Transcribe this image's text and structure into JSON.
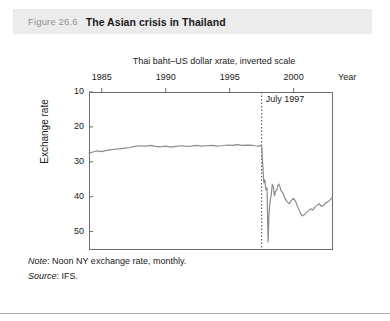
{
  "figure": {
    "number": "Figure 26.6",
    "title": "The Asian crisis in Thailand"
  },
  "footnotes": {
    "note_label": "Note",
    "note_text": ": Noon NY exchange rate, monthly.",
    "source_label": "Source",
    "source_text": ": IFS."
  },
  "colors": {
    "header_band": "#ececec",
    "figure_number": "#8f8f8f",
    "text": "#1a1a1a",
    "line": "#8c8c8c",
    "axis": "#6e6e6e",
    "bottom_rule": "#b0b0b0"
  },
  "chart_data": {
    "type": "line",
    "title": "Thai baht–US dollar xrate, inverted scale",
    "xlabel": "Year",
    "ylabel": "Exchange rate",
    "xlim": [
      1984.0,
      2003.0
    ],
    "ylim": [
      10,
      55
    ],
    "y_inverted": true,
    "grid": false,
    "legend": "none",
    "xticks": [
      1985,
      1990,
      1995,
      2000
    ],
    "xtick_labels": [
      "1985",
      "1990",
      "1995",
      "2000"
    ],
    "yticks": [
      10,
      20,
      30,
      40,
      50
    ],
    "ytick_labels": [
      "10",
      "20",
      "30",
      "40",
      "50"
    ],
    "annotations": [
      {
        "label": "July 1997",
        "x": 1997.5,
        "type": "vertical-dotted-line"
      }
    ],
    "series": [
      {
        "name": "Thai baht per US dollar",
        "x": [
          1984.0,
          1984.3,
          1984.6,
          1985.0,
          1985.3,
          1985.6,
          1986.0,
          1986.4,
          1986.8,
          1987.2,
          1987.6,
          1988.0,
          1988.4,
          1988.8,
          1989.2,
          1989.6,
          1990.0,
          1990.4,
          1990.8,
          1991.2,
          1991.6,
          1992.0,
          1992.4,
          1992.8,
          1993.2,
          1993.6,
          1994.0,
          1994.4,
          1994.8,
          1995.2,
          1995.6,
          1996.0,
          1996.4,
          1996.8,
          1997.0,
          1997.25,
          1997.45,
          1997.5,
          1997.58,
          1997.67,
          1997.75,
          1997.83,
          1997.92,
          1998.0,
          1998.08,
          1998.17,
          1998.25,
          1998.33,
          1998.42,
          1998.5,
          1998.58,
          1998.67,
          1998.75,
          1998.83,
          1998.92,
          1999.0,
          1999.17,
          1999.33,
          1999.5,
          1999.67,
          1999.83,
          2000.0,
          2000.17,
          2000.33,
          2000.5,
          2000.67,
          2000.83,
          2001.0,
          2001.17,
          2001.33,
          2001.5,
          2001.67,
          2001.83,
          2002.0,
          2002.17,
          2002.33,
          2002.5,
          2002.67,
          2002.83,
          2003.0
        ],
        "y": [
          27.6,
          27.2,
          26.9,
          27.1,
          26.8,
          26.6,
          26.4,
          26.3,
          26.1,
          25.9,
          25.6,
          25.4,
          25.5,
          25.3,
          25.6,
          25.7,
          25.5,
          25.8,
          25.6,
          25.4,
          25.6,
          25.5,
          25.3,
          25.5,
          25.4,
          25.3,
          25.5,
          25.4,
          25.2,
          25.3,
          25.1,
          25.3,
          25.2,
          25.3,
          25.4,
          25.5,
          25.3,
          25.4,
          30.5,
          36.0,
          35.2,
          38.0,
          37.5,
          53.0,
          44.5,
          41.0,
          39.5,
          36.5,
          37.2,
          39.8,
          38.5,
          38.2,
          37.0,
          36.4,
          37.0,
          38.2,
          39.0,
          40.5,
          41.5,
          42.0,
          41.0,
          40.5,
          41.5,
          43.0,
          44.5,
          45.5,
          45.2,
          44.5,
          44.0,
          43.5,
          43.8,
          43.0,
          42.5,
          42.0,
          42.8,
          42.5,
          41.8,
          41.5,
          41.0,
          40.3
        ]
      }
    ]
  }
}
